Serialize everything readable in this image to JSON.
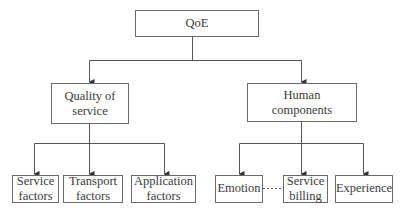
{
  "diagram": {
    "type": "hierarchy-tree",
    "root": {
      "id": "qoe",
      "label": "QoE"
    },
    "level1": [
      {
        "id": "qos",
        "label": "Quality of\nservice",
        "parent": "qoe"
      },
      {
        "id": "human",
        "label": "Human\ncomponents",
        "parent": "qoe"
      }
    ],
    "level2": [
      {
        "id": "service-factors",
        "label": "Service\nfactors",
        "parent": "qos"
      },
      {
        "id": "transport-factors",
        "label": "Transport\nfactors",
        "parent": "qos"
      },
      {
        "id": "application-factors",
        "label": "Application\nfactors",
        "parent": "qos"
      },
      {
        "id": "emotion",
        "label": "Emotion",
        "parent": "human"
      },
      {
        "id": "service-billing",
        "label": "Service\nbilling",
        "parent": "human"
      },
      {
        "id": "experience",
        "label": "Experience",
        "parent": "human"
      }
    ],
    "links": [
      {
        "from": "emotion",
        "to": "service-billing",
        "style": "dashed"
      }
    ],
    "colors": {
      "line": "#555555",
      "border": "#6a6a6a",
      "text": "#3a3a3a",
      "background": "#ffffff"
    }
  }
}
